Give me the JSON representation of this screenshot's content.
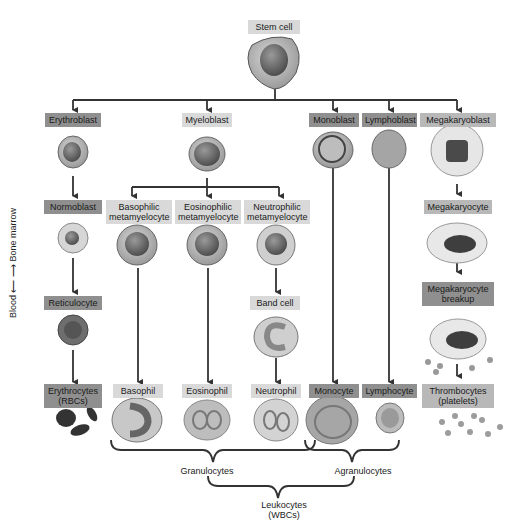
{
  "diagram": {
    "root": {
      "label": "Stem cell"
    },
    "side_axis": {
      "label": "Blood ← → Bone marrow"
    },
    "lineages": [
      {
        "name": "erythroid",
        "stages": [
          "Erythroblast",
          "Normoblast",
          "Reticulocyte",
          "Erythrocytes (RBCs)"
        ]
      },
      {
        "name": "myeloid",
        "stages": [
          "Myeloblast"
        ],
        "branches": [
          {
            "stages": [
              "Basophilic metamyelocyte",
              "Basophil"
            ]
          },
          {
            "stages": [
              "Eosinophilic metamyelocyte",
              "Eosinophil"
            ]
          },
          {
            "stages": [
              "Neutrophilic metamyelocyte",
              "Band cell",
              "Neutrophil"
            ]
          }
        ]
      },
      {
        "name": "monocytic",
        "stages": [
          "Monoblast",
          "Monocyte"
        ]
      },
      {
        "name": "lymphoid",
        "stages": [
          "Lymphoblast",
          "Lymphocyte"
        ]
      },
      {
        "name": "megakaryocytic",
        "stages": [
          "Megakaryoblast",
          "Megakaryocyte",
          "Megakaryocyte breakup",
          "Thrombocytes (platelets)"
        ]
      }
    ],
    "labels": {
      "stem": "Stem cell",
      "erythroblast": "Erythroblast",
      "myeloblast": "Myeloblast",
      "monoblast": "Monoblast",
      "lymphoblast": "Lymphoblast",
      "megakaryoblast": "Megakaryoblast",
      "normoblast": "Normoblast",
      "baso_meta_1": "Basophilic",
      "baso_meta_2": "metamyelocyte",
      "eos_meta_1": "Eosinophilic",
      "eos_meta_2": "metamyelocyte",
      "neut_meta_1": "Neutrophilic",
      "neut_meta_2": "metamyelocyte",
      "megakaryocyte": "Megakaryocyte",
      "reticulocyte": "Reticulocyte",
      "band": "Band cell",
      "mk_breakup_1": "Megakaryocyte",
      "mk_breakup_2": "breakup",
      "rbc_1": "Erythrocytes",
      "rbc_2": "(RBCs)",
      "basophil": "Basophil",
      "eosinophil": "Eosinophil",
      "neutrophil": "Neutrophil",
      "monocyte": "Monocyte",
      "lymphocyte": "Lymphocyte",
      "platelets_1": "Thrombocytes",
      "platelets_2": "(platelets)",
      "granulocytes": "Granulocytes",
      "agranulocytes": "Agranulocytes",
      "leukocytes_1": "Leukocytes",
      "leukocytes_2": "(WBCs)",
      "side_blood": "Blood",
      "side_marrow": "Bone marrow"
    },
    "colors": {
      "dark_label": "#8f8f8f",
      "mid_label": "#b8b8b8",
      "light_label": "#d9d9d9",
      "lines": "#333333"
    }
  }
}
